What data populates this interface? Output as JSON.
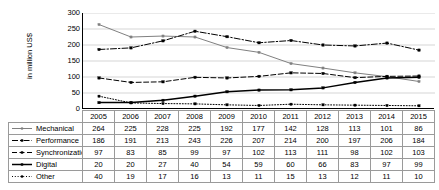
{
  "chart_data": {
    "type": "line",
    "title": "",
    "xlabel": "",
    "ylabel": "in million US$",
    "ylim": [
      0,
      300
    ],
    "yticks": [
      0,
      50,
      100,
      150,
      200,
      250,
      300
    ],
    "grid": true,
    "legend_position": "table-left-column",
    "categories": [
      "2005",
      "2006",
      "2007",
      "2008",
      "2009",
      "2010",
      "2011",
      "2012",
      "2013",
      "2014",
      "2015"
    ],
    "series": [
      {
        "name": "Mechanical",
        "style": "solid-gray-marker",
        "color": "#808080",
        "values": [
          264,
          225,
          228,
          225,
          192,
          177,
          142,
          128,
          113,
          101,
          86
        ]
      },
      {
        "name": "Performance",
        "style": "dash-dot-black-marker",
        "color": "#000000",
        "values": [
          186,
          191,
          213,
          243,
          226,
          207,
          214,
          200,
          197,
          206,
          184
        ]
      },
      {
        "name": "Synchronization",
        "style": "dashed-black-marker",
        "color": "#000000",
        "values": [
          97,
          83,
          85,
          99,
          97,
          102,
          113,
          111,
          98,
          102,
          103
        ]
      },
      {
        "name": "Digital",
        "style": "solid-bold-black-marker",
        "color": "#000000",
        "values": [
          20,
          20,
          27,
          40,
          54,
          59,
          60,
          66,
          83,
          97,
          99
        ]
      },
      {
        "name": "Other",
        "style": "dotted-black-marker",
        "color": "#000000",
        "values": [
          40,
          19,
          17,
          16,
          13,
          11,
          15,
          13,
          12,
          11,
          10
        ]
      }
    ]
  },
  "table": {
    "corner_label": "",
    "column_headers": [
      "2005",
      "2006",
      "2007",
      "2008",
      "2009",
      "2010",
      "2011",
      "2012",
      "2013",
      "2014",
      "2015"
    ],
    "rows": [
      {
        "label": "Mechanical",
        "values": [
          "264",
          "225",
          "228",
          "225",
          "192",
          "177",
          "142",
          "128",
          "113",
          "101",
          "86"
        ]
      },
      {
        "label": "Performance",
        "values": [
          "186",
          "191",
          "213",
          "243",
          "226",
          "207",
          "214",
          "200",
          "197",
          "206",
          "184"
        ]
      },
      {
        "label": "Synchronization",
        "values": [
          "97",
          "83",
          "85",
          "99",
          "97",
          "102",
          "113",
          "111",
          "98",
          "102",
          "103"
        ]
      },
      {
        "label": "Digital",
        "values": [
          "20",
          "20",
          "27",
          "40",
          "54",
          "59",
          "60",
          "66",
          "83",
          "97",
          "99"
        ]
      },
      {
        "label": "Other",
        "values": [
          "40",
          "19",
          "17",
          "16",
          "13",
          "11",
          "15",
          "13",
          "12",
          "11",
          "10"
        ]
      }
    ]
  }
}
